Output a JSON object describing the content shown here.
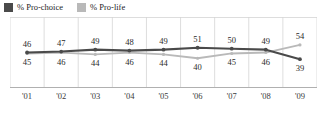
{
  "chart_data": {
    "type": "line",
    "title": "",
    "xlabel": "",
    "ylabel": "",
    "x": [
      "'01",
      "'02",
      "'03",
      "'04",
      "'05",
      "'06",
      "'07",
      "'08",
      "'09"
    ],
    "categories": [
      "'01",
      "'02",
      "'03",
      "'04",
      "'05",
      "'06",
      "'07",
      "'08",
      "'09"
    ],
    "ylim": [
      35,
      56
    ],
    "grid": "vertical",
    "legend_position": "top-left",
    "series": [
      {
        "name": "% Pro-choice",
        "color": "#4a4a4a",
        "values": [
          46,
          47,
          49,
          48,
          49,
          51,
          50,
          49,
          39
        ],
        "label_position": [
          "above",
          "above",
          "above",
          "above",
          "above",
          "above",
          "above",
          "above",
          "below"
        ]
      },
      {
        "name": "% Pro-life",
        "color": "#b9b9b9",
        "values": [
          45,
          46,
          44,
          46,
          44,
          40,
          45,
          46,
          54
        ],
        "label_position": [
          "below",
          "below",
          "below",
          "below",
          "below",
          "below",
          "below",
          "below",
          "above"
        ]
      }
    ]
  },
  "legend": {
    "items": [
      {
        "label": "% Pro-choice",
        "color": "#4a4a4a",
        "swatch_name": "legend-swatch-pro-choice"
      },
      {
        "label": "% Pro-life",
        "color": "#b9b9b9",
        "swatch_name": "legend-swatch-pro-life"
      }
    ]
  },
  "axis": {
    "ticks": [
      "'01",
      "'02",
      "'03",
      "'04",
      "'05",
      "'06",
      "'07",
      "'08",
      "'09"
    ]
  },
  "colors": {
    "pro_choice": "#4a4a4a",
    "pro_life": "#b9b9b9",
    "gridline": "#d4d4d4",
    "axis": "#b0b0b0",
    "text": "#2a2a2a",
    "background": "#ffffff"
  }
}
